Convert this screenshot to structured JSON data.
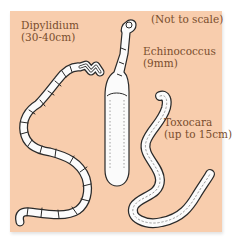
{
  "figure": {
    "background_color": "#f8cdad",
    "text_color": "#7a4e2e",
    "note": "(Not to scale)",
    "worms": [
      {
        "name": "Dipylidium",
        "size": "(30-40cm)"
      },
      {
        "name": "Echinococcus",
        "size": "(9mm)"
      },
      {
        "name": "Toxocara",
        "size": "(up to 15cm)"
      }
    ]
  }
}
